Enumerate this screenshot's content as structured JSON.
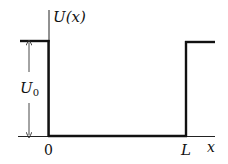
{
  "diagram": {
    "y_axis_label": "U(x)",
    "x_axis_label": "x",
    "well_depth_label": "U",
    "well_depth_subscript": "0",
    "left_edge_label": "0",
    "right_edge_label": "L",
    "colors": {
      "potential_line": "#111111",
      "axis_line": "#222222",
      "background": "#ffffff"
    }
  }
}
